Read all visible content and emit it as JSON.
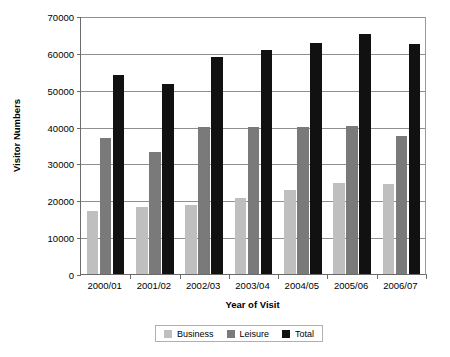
{
  "chart_data": {
    "type": "bar",
    "title": "",
    "xlabel": "Year of Visit",
    "ylabel": "Visitor Numbers",
    "categories": [
      "2000/01",
      "2001/02",
      "2002/03",
      "2003/04",
      "2004/05",
      "2005/06",
      "2006/07"
    ],
    "series": [
      {
        "name": "Business",
        "color": "#bfbfbf",
        "values": [
          17000,
          18200,
          18800,
          20500,
          22700,
          24700,
          24500
        ]
      },
      {
        "name": "Leisure",
        "color": "#7a7a7a",
        "values": [
          37000,
          33000,
          40000,
          40000,
          40000,
          40200,
          37500
        ]
      },
      {
        "name": "Total",
        "color": "#111111",
        "values": [
          54000,
          51500,
          59000,
          60700,
          62700,
          65000,
          62300
        ]
      }
    ],
    "ylim": [
      0,
      70000
    ],
    "ytick_labels": [
      "0",
      "10000",
      "20000",
      "30000",
      "40000",
      "50000",
      "60000",
      "70000"
    ],
    "ytick_values": [
      0,
      10000,
      20000,
      30000,
      40000,
      50000,
      60000,
      70000
    ],
    "grid": true,
    "legend_position": "bottom"
  }
}
